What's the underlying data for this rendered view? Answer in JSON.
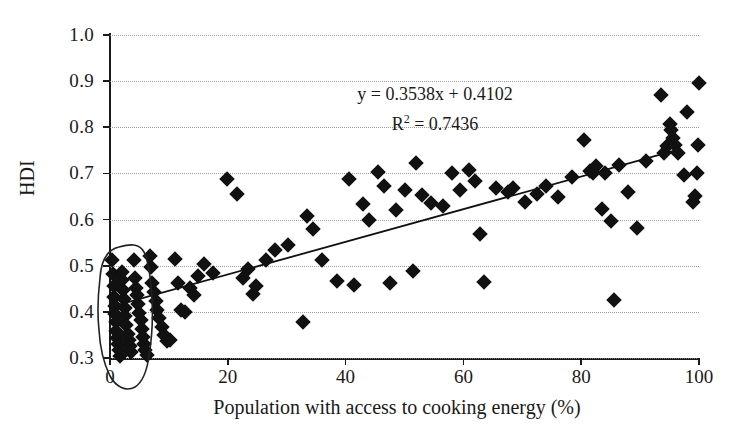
{
  "chart_data": {
    "type": "scatter",
    "title": "",
    "xlabel": "Population with access to cooking energy (%)",
    "ylabel": "HDI",
    "xlim": [
      0,
      100
    ],
    "ylim": [
      0.3,
      1.0
    ],
    "xticks": [
      "0",
      "20",
      "40",
      "60",
      "80",
      "100"
    ],
    "xtick_values": [
      0,
      20,
      40,
      60,
      80,
      100
    ],
    "yticks": [
      "0.3",
      "0.4",
      "0.5",
      "0.6",
      "0.7",
      "0.8",
      "0.9",
      "1.0"
    ],
    "ytick_values": [
      0.3,
      0.4,
      0.5,
      0.6,
      0.7,
      0.8,
      0.9,
      1.0
    ],
    "grid": true,
    "grid_axis": "y",
    "grid_style": "dotted",
    "legend": null,
    "marker": "diamond",
    "marker_color": "#111111",
    "annotations": [
      {
        "name": "regression-equation",
        "text": "y = 0.3538x + 0.4102"
      },
      {
        "name": "r-squared",
        "text": "R² = 0.7436"
      },
      {
        "name": "hand-drawn-ellipse",
        "text": ""
      }
    ],
    "trendline": {
      "type": "linear",
      "slope": 0.3538,
      "intercept": 0.4102,
      "slope_per_percent": 0.003538,
      "r_squared": 0.7436,
      "equation": "y = 0.3538x + 0.4102",
      "x_start": 0,
      "x_end": 96,
      "y_start": 0.4102,
      "y_end": 0.7499
    },
    "points": [
      [
        0.4,
        0.512
      ],
      [
        0.5,
        0.482
      ],
      [
        0.6,
        0.455
      ],
      [
        0.7,
        0.432
      ],
      [
        0.8,
        0.413
      ],
      [
        0.9,
        0.395
      ],
      [
        1.0,
        0.378
      ],
      [
        1.1,
        0.358
      ],
      [
        1.2,
        0.343
      ],
      [
        1.3,
        0.331
      ],
      [
        1.5,
        0.318
      ],
      [
        1.7,
        0.305
      ],
      [
        2.0,
        0.487
      ],
      [
        2.1,
        0.468
      ],
      [
        2.2,
        0.447
      ],
      [
        2.4,
        0.428
      ],
      [
        2.5,
        0.409
      ],
      [
        2.6,
        0.392
      ],
      [
        2.8,
        0.372
      ],
      [
        3.0,
        0.352
      ],
      [
        3.2,
        0.338
      ],
      [
        3.4,
        0.325
      ],
      [
        3.6,
        0.312
      ],
      [
        4.0,
        0.512
      ],
      [
        4.2,
        0.474
      ],
      [
        4.4,
        0.452
      ],
      [
        4.6,
        0.436
      ],
      [
        4.8,
        0.418
      ],
      [
        5.0,
        0.398
      ],
      [
        5.2,
        0.382
      ],
      [
        5.4,
        0.362
      ],
      [
        5.6,
        0.345
      ],
      [
        5.8,
        0.33
      ],
      [
        6.0,
        0.318
      ],
      [
        6.3,
        0.307
      ],
      [
        6.8,
        0.522
      ],
      [
        7.0,
        0.497
      ],
      [
        7.2,
        0.462
      ],
      [
        7.5,
        0.444
      ],
      [
        7.8,
        0.424
      ],
      [
        8.0,
        0.405
      ],
      [
        8.4,
        0.387
      ],
      [
        8.8,
        0.367
      ],
      [
        9.2,
        0.349
      ],
      [
        9.6,
        0.336
      ],
      [
        10.2,
        0.338
      ],
      [
        11.0,
        0.515
      ],
      [
        11.5,
        0.463
      ],
      [
        12.0,
        0.403
      ],
      [
        12.8,
        0.399
      ],
      [
        13.5,
        0.451
      ],
      [
        14.2,
        0.437
      ],
      [
        15.0,
        0.477
      ],
      [
        16.0,
        0.503
      ],
      [
        17.5,
        0.485
      ],
      [
        19.8,
        0.688
      ],
      [
        21.5,
        0.655
      ],
      [
        22.6,
        0.474
      ],
      [
        23.5,
        0.493
      ],
      [
        24.2,
        0.438
      ],
      [
        24.8,
        0.456
      ],
      [
        26.5,
        0.512
      ],
      [
        28.0,
        0.534
      ],
      [
        30.2,
        0.545
      ],
      [
        32.8,
        0.378
      ],
      [
        33.5,
        0.608
      ],
      [
        34.5,
        0.58
      ],
      [
        36.0,
        0.513
      ],
      [
        38.5,
        0.466
      ],
      [
        40.5,
        0.687
      ],
      [
        41.5,
        0.459
      ],
      [
        43.0,
        0.633
      ],
      [
        44.0,
        0.6
      ],
      [
        45.5,
        0.703
      ],
      [
        46.5,
        0.673
      ],
      [
        47.5,
        0.463
      ],
      [
        48.5,
        0.621
      ],
      [
        50.0,
        0.664
      ],
      [
        51.5,
        0.489
      ],
      [
        52.0,
        0.722
      ],
      [
        53.0,
        0.654
      ],
      [
        54.5,
        0.636
      ],
      [
        56.5,
        0.63
      ],
      [
        58.0,
        0.702
      ],
      [
        59.5,
        0.665
      ],
      [
        61.0,
        0.707
      ],
      [
        62.0,
        0.683
      ],
      [
        62.8,
        0.569
      ],
      [
        63.5,
        0.464
      ],
      [
        65.5,
        0.668
      ],
      [
        67.5,
        0.66
      ],
      [
        68.5,
        0.668
      ],
      [
        70.5,
        0.637
      ],
      [
        72.5,
        0.655
      ],
      [
        74.0,
        0.672
      ],
      [
        76.0,
        0.648
      ],
      [
        78.5,
        0.692
      ],
      [
        80.5,
        0.772
      ],
      [
        81.5,
        0.706
      ],
      [
        82.0,
        0.7
      ],
      [
        82.5,
        0.716
      ],
      [
        83.5,
        0.623
      ],
      [
        84.0,
        0.701
      ],
      [
        85.0,
        0.596
      ],
      [
        85.5,
        0.425
      ],
      [
        86.5,
        0.718
      ],
      [
        88.0,
        0.659
      ],
      [
        89.5,
        0.582
      ],
      [
        91.0,
        0.728
      ],
      [
        93.5,
        0.869
      ],
      [
        94.0,
        0.745
      ],
      [
        94.5,
        0.76
      ],
      [
        95.0,
        0.808
      ],
      [
        95.3,
        0.795
      ],
      [
        95.6,
        0.776
      ],
      [
        96.0,
        0.762
      ],
      [
        96.5,
        0.745
      ],
      [
        97.5,
        0.697
      ],
      [
        98.0,
        0.834
      ],
      [
        99.0,
        0.637
      ],
      [
        99.3,
        0.652
      ],
      [
        99.6,
        0.7
      ],
      [
        99.8,
        0.762
      ],
      [
        100.0,
        0.897
      ]
    ]
  }
}
